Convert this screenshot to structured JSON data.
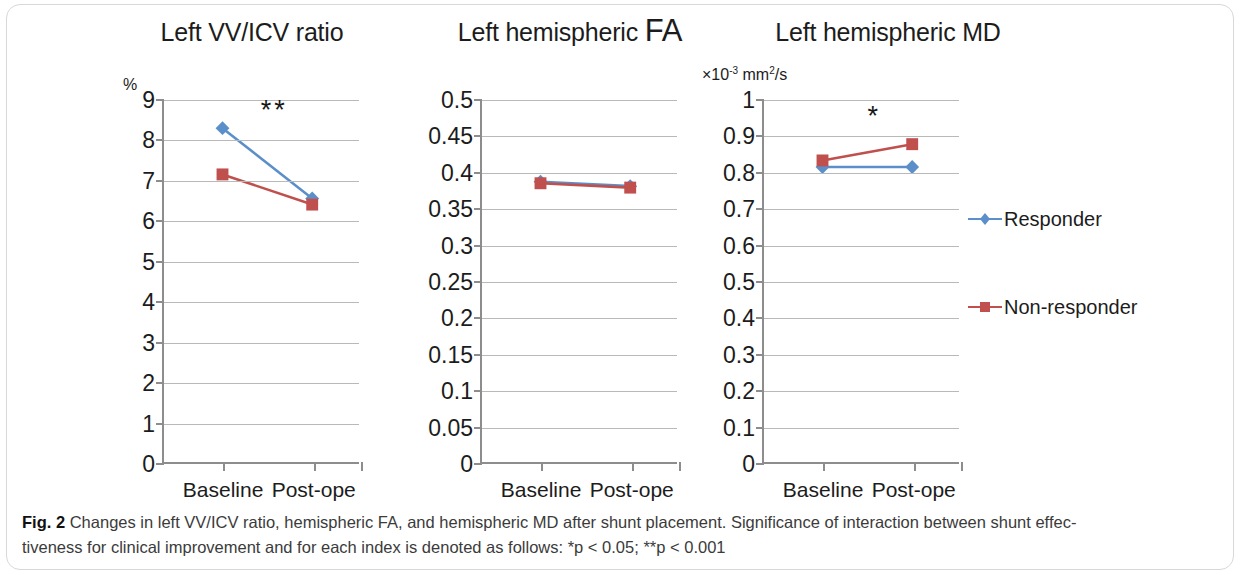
{
  "figure": {
    "caption_label": "Fig. 2",
    "caption_line1": "Changes in left VV/ICV ratio, hemispheric FA, and hemispheric MD after shunt placement. Significance of interaction between shunt effec-",
    "caption_line2": "tiveness for clinical improvement and for each index is denoted as follows: *p < 0.05; **p < 0.001"
  },
  "legend": {
    "responder_label": "Responder",
    "nonresponder_label": "Non-responder",
    "responder_color": "#5b8fc9",
    "nonresponder_color": "#c0504d"
  },
  "chart_data": [
    {
      "type": "line",
      "title": "Left VV/ICV ratio",
      "title_tail": "",
      "ylabel": "%",
      "xlabel": "",
      "categories": [
        "Baseline",
        "Post-ope"
      ],
      "x": [
        "Baseline",
        "Post-ope"
      ],
      "series": [
        {
          "name": "Responder",
          "values": [
            8.3,
            6.55
          ],
          "color": "#5b8fc9",
          "marker": "diamond"
        },
        {
          "name": "Non-responder",
          "values": [
            7.15,
            6.4
          ],
          "color": "#c0504d",
          "marker": "square"
        }
      ],
      "ylim": [
        0,
        9
      ],
      "ytick_step": 1,
      "yticks": [
        "9",
        "8",
        "7",
        "6",
        "5",
        "4",
        "3",
        "2",
        "1",
        "0"
      ],
      "ytick_values": [
        9,
        8,
        7,
        6,
        5,
        4,
        3,
        2,
        1,
        0
      ],
      "grid": true,
      "annotation": "**",
      "annotation_y": 8.75,
      "legend_position": "none"
    },
    {
      "type": "line",
      "title": "Left hemispheric ",
      "title_tail": "FA",
      "ylabel": "",
      "xlabel": "",
      "categories": [
        "Baseline",
        "Post-ope"
      ],
      "x": [
        "Baseline",
        "Post-ope"
      ],
      "series": [
        {
          "name": "Responder",
          "values": [
            0.387,
            0.381
          ],
          "color": "#5b8fc9",
          "marker": "diamond"
        },
        {
          "name": "Non-responder",
          "values": [
            0.385,
            0.379
          ],
          "color": "#c0504d",
          "marker": "square"
        }
      ],
      "ylim": [
        0,
        0.5
      ],
      "ytick_step": 0.05,
      "yticks": [
        "0.5",
        "0.45",
        "0.4",
        "0.35",
        "0.3",
        "0.25",
        "0.2",
        "0.15",
        "0.1",
        "0.05",
        "0"
      ],
      "ytick_values": [
        0.5,
        0.45,
        0.4,
        0.35,
        0.3,
        0.25,
        0.2,
        0.15,
        0.1,
        0.05,
        0
      ],
      "grid": true,
      "annotation": "",
      "annotation_y": null,
      "legend_position": "none"
    },
    {
      "type": "line",
      "title": "Left hemispheric MD",
      "title_tail": "",
      "ylabel": "×10-3 mm2/s",
      "ylabel_parts": {
        "prefix": "×10",
        "exp1": "-3",
        "mid": " mm",
        "exp2": "2",
        "suffix": "/s"
      },
      "xlabel": "",
      "categories": [
        "Baseline",
        "Post-ope"
      ],
      "x": [
        "Baseline",
        "Post-ope"
      ],
      "series": [
        {
          "name": "Responder",
          "values": [
            0.815,
            0.815
          ],
          "color": "#5b8fc9",
          "marker": "diamond"
        },
        {
          "name": "Non-responder",
          "values": [
            0.833,
            0.878
          ],
          "color": "#c0504d",
          "marker": "square"
        }
      ],
      "ylim": [
        0,
        1
      ],
      "ytick_step": 0.1,
      "yticks": [
        "1",
        "0.9",
        "0.8",
        "0.7",
        "0.6",
        "0.5",
        "0.4",
        "0.3",
        "0.2",
        "0.1",
        "0"
      ],
      "ytick_values": [
        1,
        0.9,
        0.8,
        0.7,
        0.6,
        0.5,
        0.4,
        0.3,
        0.2,
        0.1,
        0
      ],
      "grid": true,
      "annotation": "*",
      "annotation_y": 0.955,
      "legend_position": "right"
    }
  ]
}
